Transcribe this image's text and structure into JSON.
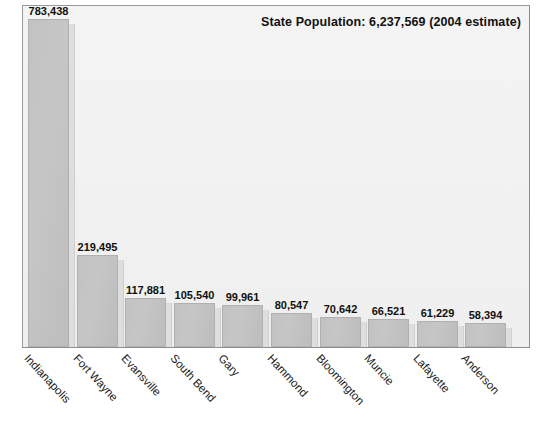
{
  "chart_data": {
    "type": "bar",
    "title": "State Population: 6,237,569  (2004 estimate)",
    "xlabel": "",
    "ylabel": "",
    "ylim": [
      0,
      820000
    ],
    "grid": false,
    "legend": "none",
    "orientation": "vertical",
    "categories": [
      "Indianapolis",
      "Fort Wayne",
      "Evansville",
      "South Bend",
      "Gary",
      "Hammond",
      "Bloomington",
      "Muncie",
      "Lafayette",
      "Anderson"
    ],
    "values": [
      783438,
      219495,
      117881,
      105540,
      99961,
      80547,
      70642,
      66521,
      61229,
      58394
    ],
    "value_labels": [
      "783,438",
      "219,495",
      "117,881",
      "105,540",
      "99,961",
      "80,547",
      "70,642",
      "66,521",
      "61,229",
      "58,394"
    ],
    "annotations": [
      "State Population: 6,237,569  (2004 estimate)"
    ]
  },
  "colors": {
    "bar_fill": "#c4c4c4",
    "bar_shadow": "#dedede",
    "plot_background": "#f2f2f2",
    "frame_border": "#8e8e8e",
    "text": "#111111",
    "page_background": "#ffffff"
  },
  "plot": {
    "title_text": "State Population: 6,237,569  (2004 estimate)"
  }
}
